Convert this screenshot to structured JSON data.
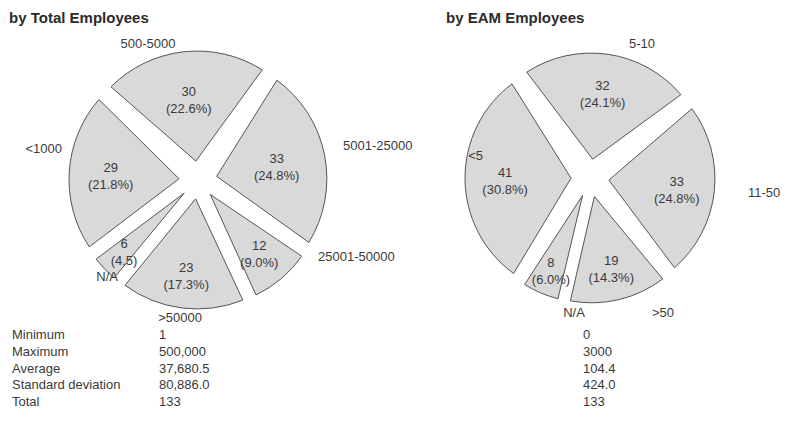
{
  "charts": {
    "left": {
      "title": "by Total Employees"
    },
    "right": {
      "title": "by EAM Employees"
    }
  },
  "stats": {
    "labels": [
      "Minimum",
      "Maximum",
      "Average",
      "Standard deviation",
      "Total"
    ],
    "total_employees": [
      "1",
      "500,000",
      "37,680.5",
      "80,886.0",
      "133"
    ],
    "eam_employees": [
      "0",
      "3000",
      "104.4",
      "424.0",
      "133"
    ]
  },
  "style": {
    "slice_fill": "#d9d9d9",
    "slice_stroke": "#555555",
    "text_color": "#3a3a3a"
  },
  "chart_data": [
    {
      "type": "pie",
      "title": "by Total Employees",
      "categories": [
        "500-5000",
        "5001-25000",
        "25001-50000",
        ">50000",
        "N/A",
        "<1000"
      ],
      "values": [
        30,
        33,
        12,
        23,
        6,
        29
      ],
      "percent_labels": [
        "(22.6%)",
        "(24.8%)",
        "(9.0%)",
        "(17.3%)",
        "(4.5)",
        "(21.8%)"
      ],
      "total": 133,
      "exploded": true,
      "start_angle_deg": -137,
      "direction": "clockwise"
    },
    {
      "type": "pie",
      "title": "by EAM Employees",
      "categories": [
        "5-10",
        "11-50",
        ">50",
        "N/A",
        "<5"
      ],
      "values": [
        32,
        33,
        19,
        8,
        41
      ],
      "percent_labels": [
        "(24.1%)",
        "(24.8%)",
        "(14.3%)",
        "(6.0%)",
        "(30.8%)"
      ],
      "total": 133,
      "exploded": true,
      "start_angle_deg": -125,
      "direction": "clockwise"
    }
  ]
}
